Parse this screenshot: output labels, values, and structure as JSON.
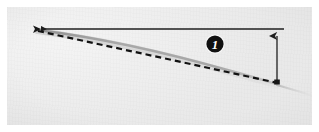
{
  "figure": {
    "kind": "photograph-with-annotations",
    "width_px": 319,
    "height_px": 132,
    "background_color": "#ececec",
    "mat_color": "#ffffff",
    "ink_color": "#1a1a1a",
    "specimen_color": "#9a9a9a"
  },
  "callouts": [
    {
      "id": "callout-1",
      "label": "1",
      "shape": "filled-circle",
      "fill": "#111111",
      "text_color": "#ffffff",
      "center_x": 215,
      "center_y": 44,
      "radius": 9
    }
  ],
  "annotations": {
    "reference_line": {
      "name": "horizontal-reference-line",
      "style": "solid",
      "stroke": "#1f1f1f",
      "x1": 36,
      "y1": 29,
      "x2": 284,
      "y2": 29,
      "arrowhead": "left"
    },
    "chord_line": {
      "name": "dashed-chord-line",
      "style": "dashed",
      "stroke": "#121212",
      "x1": 37,
      "y1": 31,
      "x2": 278,
      "y2": 83,
      "dash_pattern": "6 4"
    },
    "deflection_arrow": {
      "name": "vertical-deflection-arrow",
      "style": "solid",
      "stroke": "#1f1f1f",
      "x": 277,
      "y_top": 33,
      "y_bottom": 83,
      "arrowhead": "up"
    },
    "specimen_curve": {
      "name": "deflected-beam-curve",
      "stroke": "#9c9c9c",
      "start_x": 37,
      "start_y": 30,
      "end_x": 277,
      "end_y": 84,
      "trailing_x": 314,
      "trailing_y": 96
    },
    "fixed_end": {
      "name": "clamped-end-marker",
      "x": 36,
      "y": 29
    }
  }
}
